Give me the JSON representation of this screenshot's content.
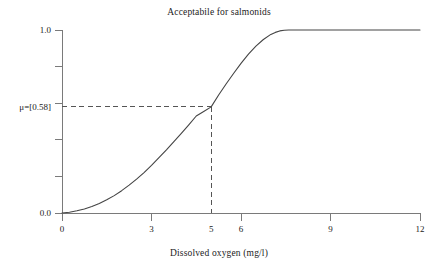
{
  "chart_data": {
    "type": "line",
    "title": "Acceptabile for salmonids",
    "xlabel": "Dissolved oxygen (mg/l)",
    "ylabel": "",
    "xlim": [
      0,
      12
    ],
    "ylim": [
      0,
      1.0
    ],
    "grid": false,
    "legend": "none",
    "x_ticks": [
      0,
      3,
      6,
      9,
      12
    ],
    "x_tick_labels": [
      "0",
      "3",
      "6",
      "9",
      "12"
    ],
    "x_extra_labels": [
      {
        "value": 5,
        "label": "5",
        "tick": false
      }
    ],
    "y_ticks": [
      0.0,
      0.2,
      0.4,
      0.6,
      0.8,
      1.0
    ],
    "y_tick_labels": [
      "0.0",
      "",
      "",
      "",
      "",
      "1.0"
    ],
    "series": [
      {
        "name": "membership",
        "x": [
          0.0,
          0.25,
          0.5,
          0.75,
          1.0,
          1.25,
          1.5,
          1.75,
          2.0,
          2.25,
          2.5,
          2.75,
          3.0,
          3.25,
          3.5,
          3.75,
          4.0,
          4.25,
          4.5,
          4.75,
          5.0,
          5.25,
          5.5,
          5.75,
          6.0,
          6.25,
          6.5,
          6.75,
          7.0,
          7.15,
          7.3,
          7.45,
          7.6,
          8.0,
          9.0,
          10.0,
          11.0,
          12.0
        ],
        "y": [
          0.0,
          0.004,
          0.012,
          0.022,
          0.035,
          0.052,
          0.072,
          0.095,
          0.122,
          0.152,
          0.185,
          0.221,
          0.26,
          0.302,
          0.345,
          0.39,
          0.435,
          0.482,
          0.53,
          0.555,
          0.58,
          0.645,
          0.705,
          0.762,
          0.818,
          0.868,
          0.912,
          0.948,
          0.976,
          0.987,
          0.995,
          0.999,
          1.0,
          1.0,
          1.0,
          1.0,
          1.0,
          1.0
        ]
      }
    ],
    "annotations": [
      {
        "name": "mu-crosshair",
        "label": "μ=[0.58]",
        "x": 5,
        "y": 0.58,
        "style": "dashed"
      }
    ],
    "colors": {
      "curve": "#444444",
      "axis": "#7a7a7a",
      "dashed": "#555555",
      "text": "#222222",
      "background": "#ffffff"
    }
  },
  "labels": {
    "mu": "μ=[0.58]",
    "y_zero": "0.0",
    "y_one": "1.0",
    "x0": "0",
    "x3": "3",
    "x5": "5",
    "x6": "6",
    "x9": "9",
    "x12": "12"
  }
}
